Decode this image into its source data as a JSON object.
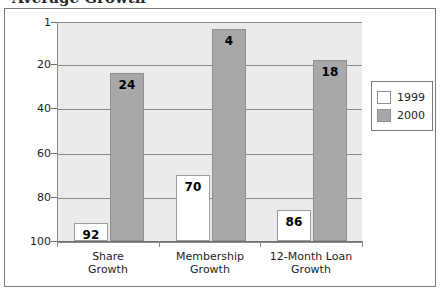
{
  "figure": {
    "cut_off_title_fragment": "Average Growth",
    "legend": {
      "position": "right",
      "entries": [
        {
          "label": "1999",
          "swatch": "white-swatch"
        },
        {
          "label": "2000",
          "swatch": "gray-swatch"
        }
      ]
    }
  },
  "chart_data": {
    "type": "bar",
    "title": "",
    "xlabel": "",
    "ylabel": "",
    "categories": [
      "Share\nGrowth",
      "Membership\nGrowth",
      "12-Month Loan\nGrowth"
    ],
    "category_lines": [
      [
        "Share",
        "Growth"
      ],
      [
        "Membership",
        "Growth"
      ],
      [
        "12-Month Loan",
        "Growth"
      ]
    ],
    "series": [
      {
        "name": "1999",
        "values": [
          92,
          70,
          86
        ],
        "color": "#ffffff"
      },
      {
        "name": "2000",
        "values": [
          24,
          4,
          18
        ],
        "color": "#a8a8a8"
      }
    ],
    "ylim": [
      1,
      100
    ],
    "y_inverted": true,
    "yticks": [
      1,
      20,
      40,
      60,
      80,
      100
    ],
    "ytick_labels": [
      "1",
      "20",
      "40",
      "60",
      "80",
      "100"
    ],
    "grid": true,
    "legend_position": "right",
    "note": "Axis is a rank scale: 1 at top is best, 100 at bottom is worst"
  },
  "colors": {
    "series_1999": "#ffffff",
    "series_2000": "#a8a8a8",
    "plot_background": "#ebebeb",
    "gridline": "#8a8a8a",
    "frame_border": "#77797c",
    "text": "#1d1d1d"
  }
}
